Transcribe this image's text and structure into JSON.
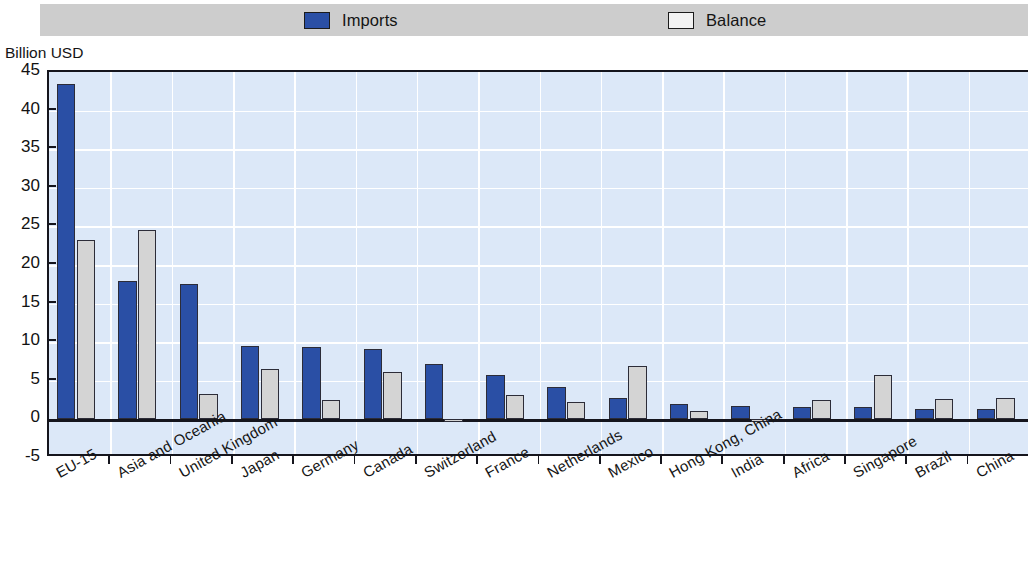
{
  "legend": {
    "entries": [
      {
        "label": "Imports",
        "color": "#2a4fa5",
        "icon": "filled-square-icon"
      },
      {
        "label": "Balance",
        "color": "#f2f2f2",
        "icon": "outline-square-icon"
      }
    ]
  },
  "axis": {
    "y_title": "Billion USD",
    "ticks": [
      "45",
      "40",
      "35",
      "30",
      "25",
      "20",
      "15",
      "10",
      "5",
      "0",
      "-5"
    ]
  },
  "chart_data": {
    "type": "bar",
    "title": "",
    "subtitle": "",
    "xlabel": "",
    "ylabel": "Billion USD",
    "ylim": [
      -5,
      45
    ],
    "ytick_step": 5,
    "grid": true,
    "legend_position": "top",
    "categories": [
      "EU-15",
      "Asia and Oceania",
      "United Kingdom",
      "Japan",
      "Germany",
      "Canada",
      "Switzerland",
      "France",
      "Netherlands",
      "Mexico",
      "Hong Kong, China",
      "India",
      "Africa",
      "Singapore",
      "Brazil",
      "China"
    ],
    "series": [
      {
        "name": "Imports",
        "color": "#2a4fa5",
        "values": [
          43.5,
          17.9,
          17.6,
          9.5,
          9.4,
          9.1,
          7.2,
          5.7,
          4.2,
          2.8,
          2.0,
          1.8,
          1.6,
          1.6,
          1.4,
          1.3
        ]
      },
      {
        "name": "Balance",
        "color": "#d4d4d4",
        "values": [
          23.2,
          24.5,
          3.3,
          6.5,
          2.5,
          6.2,
          -0.3,
          3.1,
          2.2,
          6.9,
          1.1,
          -0.3,
          2.5,
          5.8,
          2.7,
          2.8
        ]
      }
    ]
  }
}
